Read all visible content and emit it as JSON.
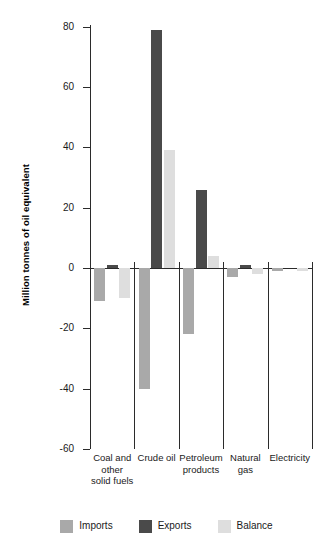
{
  "chart_data": {
    "type": "bar",
    "title": "",
    "xlabel": "",
    "ylabel": "Million tonnes of oil equivalent",
    "ylim": [
      -60,
      80
    ],
    "yticks": [
      80,
      60,
      40,
      20,
      0,
      -20,
      -40,
      -60
    ],
    "ytick_labels": [
      "80",
      "60",
      "40",
      "20",
      "0",
      "-20",
      "-40",
      "-60"
    ],
    "grid": false,
    "legend_position": "bottom",
    "categories": [
      "Coal and other solid fuels",
      "Crude oil",
      "Petroleum products",
      "Natural gas",
      "Electricity"
    ],
    "category_label_lines": [
      [
        "Coal and",
        "other",
        "solid fuels"
      ],
      [
        "Crude oil"
      ],
      [
        "Petroleum",
        "products"
      ],
      [
        "Natural",
        "gas"
      ],
      [
        "Electricity"
      ]
    ],
    "series": [
      {
        "name": "Imports",
        "color": "#a9a9a9",
        "values": [
          -11,
          -40,
          -22,
          -3,
          -1
        ]
      },
      {
        "name": "Exports",
        "color": "#4a4a4a",
        "values": [
          1,
          79,
          26,
          1,
          0
        ]
      },
      {
        "name": "Balance",
        "color": "#dedede",
        "values": [
          -10,
          39,
          4,
          -2,
          -1
        ]
      }
    ]
  },
  "legend": {
    "items": [
      {
        "label": "Imports",
        "key": "imports"
      },
      {
        "label": "Exports",
        "key": "exports"
      },
      {
        "label": "Balance",
        "key": "balance"
      }
    ]
  }
}
